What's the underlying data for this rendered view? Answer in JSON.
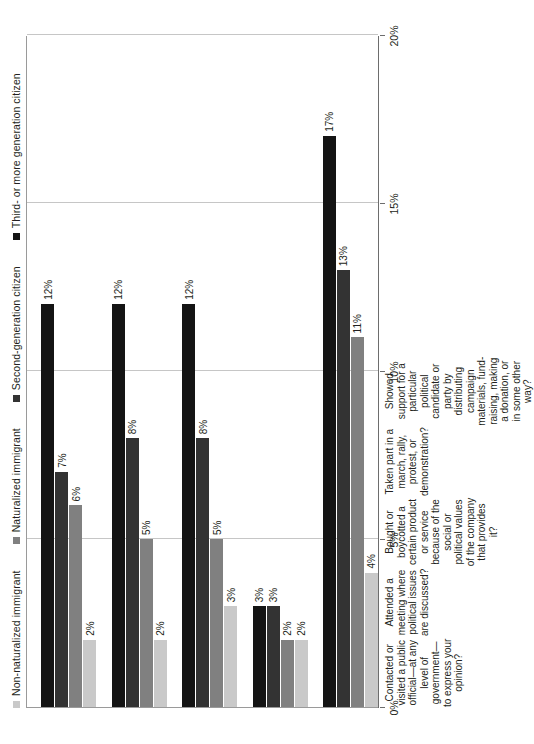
{
  "chart_data": {
    "type": "bar",
    "orientation": "horizontal",
    "title": "",
    "subtitle": "",
    "xlabel": "",
    "ylabel": "",
    "xlim": [
      0,
      20
    ],
    "x_ticks": [
      "0%",
      "5%",
      "10%",
      "15%",
      "20%"
    ],
    "x_tick_values": [
      0,
      5,
      10,
      15,
      20
    ],
    "grid": true,
    "legend_position": "top",
    "categories": [
      "Contacted or visited a public official—at any level of government—to express your opinion?",
      "Attended a meeting where political issues are discussed?",
      "Bought or boycotted a certain product or service because of the social or political values of the company that provides it?",
      "Taken part in a march, rally, protest, or demonstration?",
      "Showed support for a particular political candidate or party by distributing campaign materials, fund-raising, making a donation, or in some other way?"
    ],
    "series": [
      {
        "name": "Non-naturalized immigrant",
        "color": "#c9c9c9",
        "values": [
          2,
          2,
          3,
          2,
          4
        ],
        "labels": [
          "2%",
          "2%",
          "3%",
          "2%",
          "4%"
        ]
      },
      {
        "name": "Naturalized immigrant",
        "color": "#808080",
        "values": [
          6,
          5,
          5,
          2,
          11
        ],
        "labels": [
          "6%",
          "5%",
          "5%",
          "2%",
          "11%"
        ]
      },
      {
        "name": "Second-generation citizen",
        "color": "#333333",
        "values": [
          7,
          8,
          8,
          3,
          13
        ],
        "labels": [
          "7%",
          "8%",
          "8%",
          "3%",
          "13%"
        ]
      },
      {
        "name": "Third- or more generation citizen",
        "color": "#141414",
        "values": [
          12,
          12,
          12,
          3,
          17
        ],
        "labels": [
          "12%",
          "12%",
          "12%",
          "3%",
          "17%"
        ]
      }
    ]
  }
}
